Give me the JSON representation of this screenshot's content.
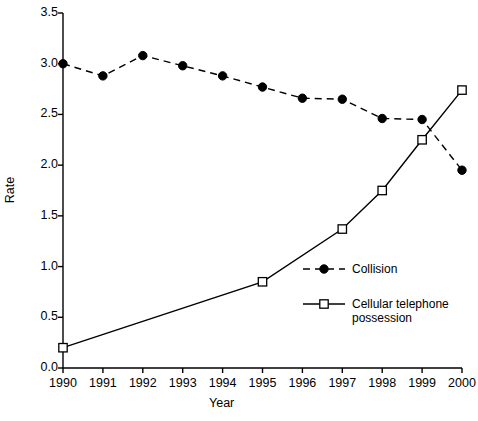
{
  "chart_data": {
    "type": "line",
    "title": "",
    "xlabel": "Year",
    "ylabel": "Rate",
    "x": [
      1990,
      1991,
      1992,
      1993,
      1994,
      1995,
      1996,
      1997,
      1998,
      1999,
      2000
    ],
    "categories": [
      "1990",
      "1991",
      "1992",
      "1993",
      "1994",
      "1995",
      "1996",
      "1997",
      "1998",
      "1999",
      "2000"
    ],
    "xlim": [
      1990,
      2000
    ],
    "ylim": [
      0.0,
      3.5
    ],
    "ytick_labels": [
      "0.0",
      "0.5",
      "1.0",
      "1.5",
      "2.0",
      "2.5",
      "3.0",
      "3.5"
    ],
    "ytick_values": [
      0.0,
      0.5,
      1.0,
      1.5,
      2.0,
      2.5,
      3.0,
      3.5
    ],
    "grid": false,
    "legend_position": "center-right",
    "series": [
      {
        "name": "Collision",
        "marker": "filled-circle",
        "line_style": "dashed",
        "color": "#000000",
        "x": [
          1990,
          1991,
          1992,
          1993,
          1994,
          1995,
          1996,
          1997,
          1998,
          1999,
          2000
        ],
        "values": [
          3.0,
          2.88,
          3.08,
          2.98,
          2.88,
          2.77,
          2.66,
          2.65,
          2.46,
          2.45,
          1.95
        ]
      },
      {
        "name": "Cellular telephone possession",
        "marker": "open-square",
        "line_style": "solid",
        "color": "#000000",
        "x": [
          1990,
          1995,
          1997,
          1998,
          1999,
          2000
        ],
        "values": [
          0.2,
          0.85,
          1.37,
          1.75,
          2.25,
          2.74
        ]
      }
    ]
  },
  "axes": {
    "y_title": "Rate",
    "x_title": "Year"
  },
  "legend": {
    "entries": [
      {
        "label": "Collision",
        "marker": "filled-circle",
        "line_style": "dashed"
      },
      {
        "label": "Cellular telephone\npossession",
        "marker": "open-square",
        "line_style": "solid"
      }
    ]
  }
}
